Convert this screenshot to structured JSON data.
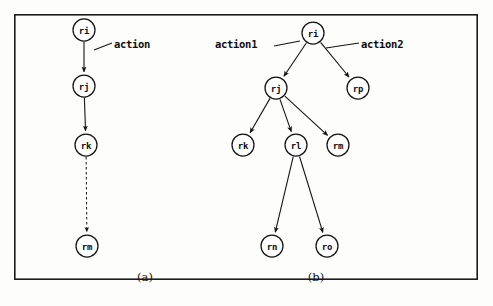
{
  "figure": {
    "frame": {
      "x": 14,
      "y": 14,
      "width": 464,
      "height": 266
    },
    "background_color": "#fdfdfc",
    "ink_color": "#141414"
  },
  "panels": [
    {
      "id": "panel-a",
      "caption": "(a)",
      "caption_pos": {
        "x": 145,
        "y": 277
      },
      "nodes": [
        {
          "id": "a-ri",
          "label": "ri",
          "x": 84,
          "y": 30,
          "r": 11
        },
        {
          "id": "a-rj",
          "label": "rj",
          "x": 84,
          "y": 86,
          "r": 11
        },
        {
          "id": "a-rk",
          "label": "rk",
          "x": 86,
          "y": 145,
          "r": 11
        },
        {
          "id": "a-rm",
          "label": "rm",
          "x": 87,
          "y": 246,
          "r": 11
        }
      ],
      "edges": [
        {
          "id": "a-e1",
          "from": "a-ri",
          "to": "a-rj",
          "style": "solid",
          "arrow": true
        },
        {
          "id": "a-e2",
          "from": "a-rj",
          "to": "a-rk",
          "style": "solid",
          "arrow": true
        },
        {
          "id": "a-e3",
          "from": "a-rk",
          "to": "a-rm",
          "style": "dashed",
          "arrow": true
        }
      ],
      "annotations": [
        {
          "id": "a-action",
          "text": "action",
          "text_x": 114,
          "text_y": 44,
          "leader": {
            "x1": 112,
            "y1": 43,
            "x2": 94,
            "y2": 50
          }
        }
      ]
    },
    {
      "id": "panel-b",
      "caption": "(b)",
      "caption_pos": {
        "x": 316,
        "y": 277
      },
      "nodes": [
        {
          "id": "b-ri",
          "label": "ri",
          "x": 313,
          "y": 33,
          "r": 11
        },
        {
          "id": "b-rj",
          "label": "rj",
          "x": 276,
          "y": 88,
          "r": 11
        },
        {
          "id": "b-rp",
          "label": "rp",
          "x": 358,
          "y": 88,
          "r": 11
        },
        {
          "id": "b-rk",
          "label": "rk",
          "x": 243,
          "y": 145,
          "r": 11
        },
        {
          "id": "b-rl",
          "label": "rl",
          "x": 296,
          "y": 145,
          "r": 11
        },
        {
          "id": "b-rm",
          "label": "rm",
          "x": 338,
          "y": 145,
          "r": 11
        },
        {
          "id": "b-rn",
          "label": "rn",
          "x": 272,
          "y": 246,
          "r": 11
        },
        {
          "id": "b-ro",
          "label": "ro",
          "x": 327,
          "y": 246,
          "r": 11
        }
      ],
      "edges": [
        {
          "id": "b-e1",
          "from": "b-ri",
          "to": "b-rj",
          "style": "solid",
          "arrow": true
        },
        {
          "id": "b-e2",
          "from": "b-ri",
          "to": "b-rp",
          "style": "solid",
          "arrow": true
        },
        {
          "id": "b-e3",
          "from": "b-rj",
          "to": "b-rk",
          "style": "solid",
          "arrow": true
        },
        {
          "id": "b-e4",
          "from": "b-rj",
          "to": "b-rl",
          "style": "solid",
          "arrow": true
        },
        {
          "id": "b-e5",
          "from": "b-rj",
          "to": "b-rm",
          "style": "solid",
          "arrow": true
        },
        {
          "id": "b-e6",
          "from": "b-rl",
          "to": "b-rn",
          "style": "solid",
          "arrow": true
        },
        {
          "id": "b-e7",
          "from": "b-rl",
          "to": "b-ro",
          "style": "solid",
          "arrow": true
        }
      ],
      "annotations": [
        {
          "id": "b-action1",
          "text": "action1",
          "text_x": 215,
          "text_y": 44,
          "leader": {
            "x1": 274,
            "y1": 46,
            "x2": 300,
            "y2": 41
          }
        },
        {
          "id": "b-action2",
          "text": "action2",
          "text_x": 361,
          "text_y": 44,
          "leader": {
            "x1": 359,
            "y1": 43,
            "x2": 326,
            "y2": 48
          }
        }
      ]
    }
  ]
}
